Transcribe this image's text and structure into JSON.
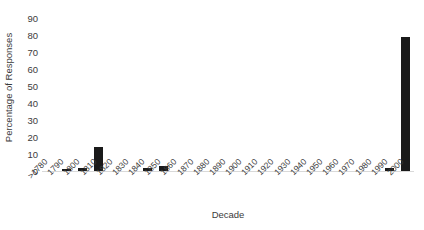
{
  "chart_data": {
    "type": "bar",
    "title": "",
    "xlabel": "Decade",
    "ylabel": "Percentage of Responses",
    "categories": [
      ">1780",
      "1790",
      "1800",
      "1810",
      "1820",
      "1830",
      "1840",
      "1850",
      "1860",
      "1870",
      "1880",
      "1890",
      "1900",
      "1910",
      "1920",
      "1930",
      "1940",
      "1950",
      "1960",
      "1970",
      "1980",
      "1990",
      "2000"
    ],
    "values": [
      0,
      1,
      2,
      14,
      0,
      0,
      2,
      3,
      0,
      0,
      0,
      0,
      0,
      0,
      0,
      0,
      0,
      0,
      0,
      0,
      0,
      2,
      79
    ],
    "ylim": [
      0,
      90
    ],
    "yticks": [
      0,
      10,
      20,
      30,
      40,
      50,
      60,
      70,
      80,
      90
    ],
    "ytick_labels": [
      "0",
      "10",
      "20",
      "30",
      "40",
      "50",
      "60",
      "70",
      "80",
      "90"
    ],
    "grid": false,
    "legend": false,
    "bar_color": "#1a1a1a",
    "axis_color": "#d9d9d9",
    "text_color": "#3b3b3b"
  }
}
